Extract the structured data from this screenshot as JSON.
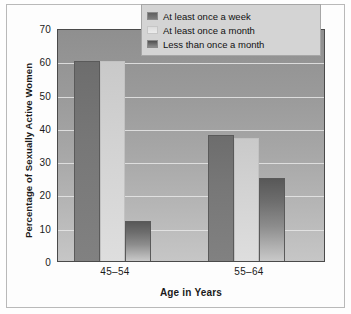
{
  "chart_data": {
    "type": "bar",
    "title": "",
    "subtitle": "",
    "xlabel": "Age in Years",
    "ylabel": "Percentage of Sexually Active Women",
    "categories": [
      "45–54",
      "55–64"
    ],
    "ylim": [
      0,
      70
    ],
    "yticks": [
      0,
      10,
      20,
      30,
      40,
      50,
      60,
      70
    ],
    "ytick_labels": [
      "0",
      "10",
      "20",
      "30",
      "40",
      "50",
      "60",
      "70"
    ],
    "grid": true,
    "grid_axis": "y",
    "legend_position": "upper right",
    "series": [
      {
        "name": "At least once a week",
        "values": [
          60,
          38
        ],
        "color": "#777777",
        "swatch": "s0"
      },
      {
        "name": "At least once a month",
        "values": [
          60,
          37
        ],
        "color": "#d6d6d6",
        "swatch": "s1"
      },
      {
        "name": "Less than once a month",
        "values": [
          12,
          25
        ],
        "color": "#757575",
        "swatch": "s2"
      }
    ]
  },
  "colors": {
    "plot_background_top": "#8f8f8f",
    "plot_background_bottom": "#c6c6c6",
    "gridline": "#e8e8e8",
    "axis": "#4a4a4a",
    "legend_background": "#d4d4d4",
    "legend_border": "#a6a6a6",
    "text": "#1a1a1a",
    "frame": "#b9b9b9",
    "page_background": "#fdfdfd"
  },
  "axes": {
    "y_tick_0": "0",
    "y_tick_1": "10",
    "y_tick_2": "20",
    "y_tick_3": "30",
    "y_tick_4": "40",
    "y_tick_5": "50",
    "y_tick_6": "60",
    "y_tick_7": "70",
    "x_tick_0": "45–54",
    "x_tick_1": "55–64",
    "x_title": "Age in Years",
    "y_title": "Percentage of Sexually Active Women"
  },
  "legend": {
    "item_0": "At least once a week",
    "item_1": "At least once a month",
    "item_2": "Less than once a month"
  }
}
